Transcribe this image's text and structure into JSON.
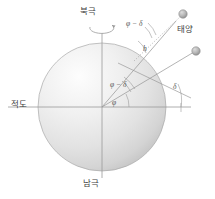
{
  "figure": {
    "labels": {
      "north_pole": "북극",
      "south_pole": "남극",
      "equator": "적도",
      "sun": "태양",
      "phi_minus_delta_top": "φ − δ",
      "phi_minus_delta_mid": "φ − δ",
      "phi": "φ",
      "delta": "δ",
      "altitude_h": "h"
    },
    "colors": {
      "line": "#9a9a9a",
      "label_text": "#4a4a4a",
      "sphere_light": "#fdfdfd",
      "sphere_mid": "#e6e6e6",
      "sphere_dark": "#c9c9c9",
      "sphere_outline": "#a8a8a8",
      "marker_fill": "#b5b5b5",
      "marker_stroke": "#8d8d8d",
      "background": "#ffffff"
    },
    "geometry": {
      "sphere_center_x": 102,
      "sphere_center_y": 107,
      "sphere_radius": 64,
      "equator_left_x": 8,
      "equator_right_x": 191,
      "axis_top_y": 33,
      "axis_bottom_y": 178,
      "zenith_ray_angle_deg": 55,
      "declination_ray_angle_deg": 26,
      "sun_marker_x": 183,
      "sun_marker_y": 14,
      "second_marker_x": 196,
      "second_marker_y": 51,
      "surface_point_x": 139,
      "surface_point_y": 55
    },
    "elements": {
      "rotation_arrow": "rotation-arrow-icon",
      "sun_marker": "sun-sphere-marker",
      "star_marker": "celestial-sphere-marker"
    }
  }
}
